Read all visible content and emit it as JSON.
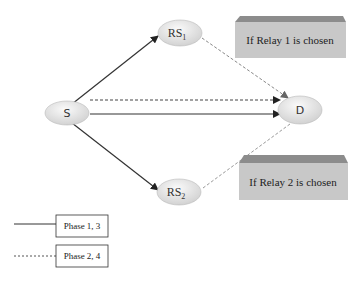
{
  "diagram": {
    "nodes": {
      "source": {
        "label": "S"
      },
      "relay1": {
        "label": "RS",
        "subscript": "1"
      },
      "relay2": {
        "label": "RS",
        "subscript": "2"
      },
      "destination": {
        "label": "D"
      }
    },
    "edges": [
      {
        "from": "S",
        "to": "RS1",
        "style": "solid"
      },
      {
        "from": "S",
        "to": "RS2",
        "style": "solid"
      },
      {
        "from": "S",
        "to": "D",
        "style": "solid"
      },
      {
        "from": "S",
        "to": "D",
        "style": "dashed"
      },
      {
        "from": "RS1",
        "to": "D",
        "style": "dashed"
      },
      {
        "from": "RS2",
        "to": "D",
        "style": "dashed"
      }
    ],
    "annotations": {
      "relay1_box": "If Relay 1 is chosen",
      "relay2_box": "If Relay 2 is chosen"
    },
    "legend": {
      "solid": "Phase 1, 3",
      "dashed": "Phase 2, 4"
    },
    "colors": {
      "node_fill": "#e6e6e6",
      "box_fill": "#c8c8c8",
      "box_top": "#8c8c8c",
      "line": "#333333",
      "dashed_line": "#888888"
    }
  }
}
